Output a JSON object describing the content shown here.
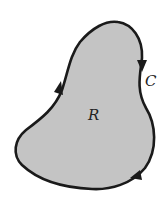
{
  "diagram": {
    "region_label": "R",
    "curve_label": "C",
    "fill_color": "#c4c4c4",
    "stroke_color": "#1a1a1a",
    "orientation": "counterclockwise"
  }
}
